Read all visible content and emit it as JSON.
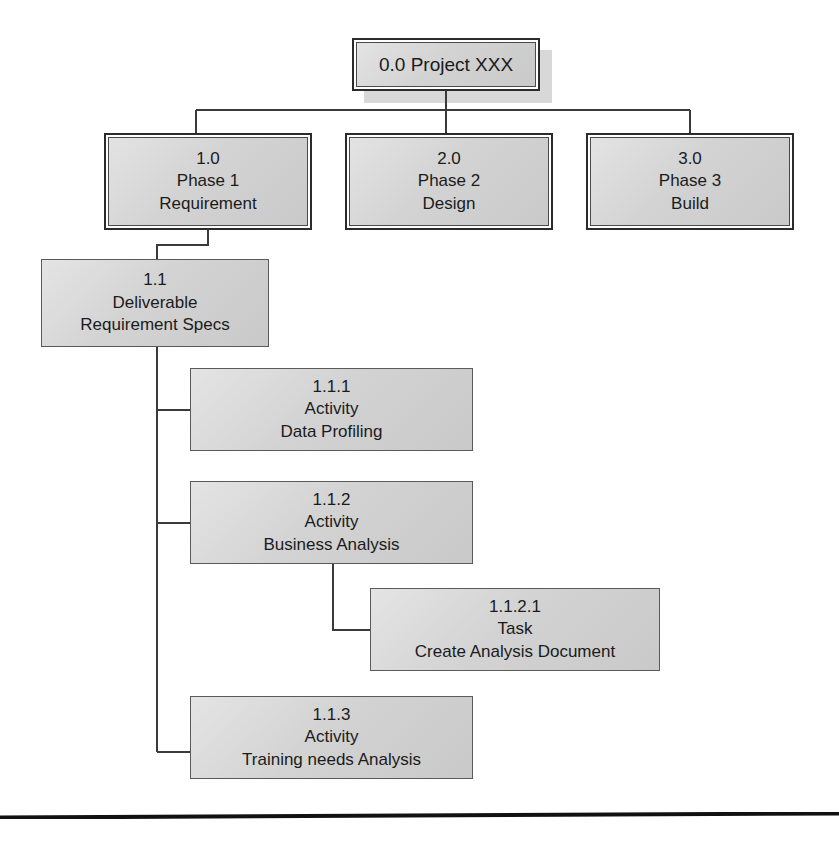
{
  "diagram": {
    "type": "work-breakdown-structure",
    "colors": {
      "node_fill": "#d5d5d5",
      "node_border": "#2b2b2b",
      "connector": "#3a3a3a",
      "background": "#ffffff",
      "footer_rule": "#111111"
    }
  },
  "nodes": {
    "root": {
      "id": "0.0",
      "label": "0.0 Project XXX",
      "level": "project",
      "lines": [
        "0.0 Project XXX"
      ]
    },
    "phase1": {
      "id": "1.0",
      "level": "phase",
      "number": "1.0",
      "type_label": "Phase 1",
      "name": "Requirement"
    },
    "phase2": {
      "id": "2.0",
      "level": "phase",
      "number": "2.0",
      "type_label": "Phase 2",
      "name": "Design"
    },
    "phase3": {
      "id": "3.0",
      "level": "phase",
      "number": "3.0",
      "type_label": "Phase 3",
      "name": "Build"
    },
    "deliverable1": {
      "id": "1.1",
      "level": "deliverable",
      "number": "1.1",
      "type_label": "Deliverable",
      "name": "Requirement Specs"
    },
    "activity1": {
      "id": "1.1.1",
      "level": "activity",
      "number": "1.1.1",
      "type_label": "Activity",
      "name": "Data Profiling"
    },
    "activity2": {
      "id": "1.1.2",
      "level": "activity",
      "number": "1.1.2",
      "type_label": "Activity",
      "name": "Business Analysis"
    },
    "task1": {
      "id": "1.1.2.1",
      "level": "task",
      "number": "1.1.2.1",
      "type_label": "Task",
      "name": "Create Analysis Document"
    },
    "activity3": {
      "id": "1.1.3",
      "level": "activity",
      "number": "1.1.3",
      "type_label": "Activity",
      "name": "Training needs Analysis"
    }
  },
  "edges": [
    {
      "from": "0.0",
      "to": "1.0"
    },
    {
      "from": "0.0",
      "to": "2.0"
    },
    {
      "from": "0.0",
      "to": "3.0"
    },
    {
      "from": "1.0",
      "to": "1.1"
    },
    {
      "from": "1.1",
      "to": "1.1.1"
    },
    {
      "from": "1.1",
      "to": "1.1.2"
    },
    {
      "from": "1.1",
      "to": "1.1.3"
    },
    {
      "from": "1.1.2",
      "to": "1.1.2.1"
    }
  ]
}
